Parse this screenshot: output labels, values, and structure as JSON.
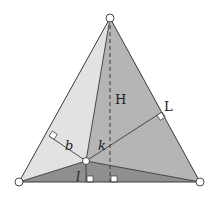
{
  "diagram": {
    "type": "equilateral-triangle-viviani",
    "vertices": {
      "top": [
        110,
        18
      ],
      "left": [
        19,
        182
      ],
      "right": [
        200,
        182
      ]
    },
    "interior_point": [
      86,
      161
    ],
    "feet": {
      "left_side": [
        49,
        136
      ],
      "right_side": [
        162,
        112
      ],
      "bottom": [
        86,
        182
      ],
      "height": [
        110,
        182
      ]
    },
    "colors": {
      "left_face": "#e2e2e2",
      "right_face": "#b5b5b5",
      "bottom_face": "#8f8f8f",
      "stroke": "#3a3a3a",
      "background": "#ffffff"
    },
    "labels": {
      "height": "H",
      "side": "L",
      "dist_left": "b",
      "dist_right": "k",
      "dist_bottom": "l"
    }
  }
}
